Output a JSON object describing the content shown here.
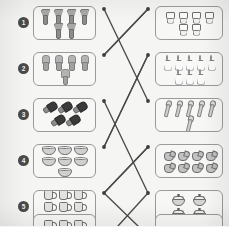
{
  "page": {
    "kind": "matching-worksheet",
    "background_color": "#f5f5f3",
    "box_border_color": "#9a9a9a",
    "line_color": "#4a4a4a",
    "marker_color": "#3d3d3d",
    "number_badge_color": "#4a4a4a",
    "visible_rows": 5,
    "partial_row_at_bottom": true
  },
  "rows": [
    {
      "number": "1",
      "left": {
        "item_name": "clothespin-clip",
        "count": 6,
        "glyph_class": "g-clip",
        "dot": {
          "x": 104,
          "y": 9
        }
      },
      "right": {
        "item_name": "small-cup-character",
        "count": 6,
        "glyph_class": "g-cupface",
        "dot": {
          "x": 148,
          "y": 9
        }
      }
    },
    {
      "number": "2",
      "left": {
        "item_name": "gray-bottle",
        "count": 5,
        "glyph_class": "g-bottle",
        "dot": {
          "x": 104,
          "y": 55
        }
      },
      "right": {
        "item_name": "candle",
        "count": 8,
        "glyph_class": "g-candle",
        "dot": {
          "x": 148,
          "y": 55
        }
      }
    },
    {
      "number": "3",
      "left": {
        "item_name": "dark-trowel",
        "count": 5,
        "glyph_class": "g-trowel",
        "dot": {
          "x": 104,
          "y": 101
        }
      },
      "right": {
        "item_name": "light-spoon",
        "count": 6,
        "glyph_class": "g-spoon",
        "dot": {
          "x": 148,
          "y": 101
        }
      }
    },
    {
      "number": "4",
      "left": {
        "item_name": "bowl",
        "count": 7,
        "glyph_class": "g-bowl",
        "dot": {
          "x": 104,
          "y": 147
        }
      },
      "right": {
        "item_name": "kettle",
        "count": 8,
        "glyph_class": "g-kettle",
        "dot": {
          "x": 148,
          "y": 147
        }
      }
    },
    {
      "number": "5",
      "left": {
        "item_name": "mug",
        "count": 8,
        "glyph_class": "g-mug",
        "dot": {
          "x": 104,
          "y": 193
        }
      },
      "right": {
        "item_name": "covered-pot",
        "count": 4,
        "glyph_class": "g-pot",
        "dot": {
          "x": 148,
          "y": 193
        }
      }
    }
  ],
  "partial_row": {
    "number": "6",
    "left": {
      "item_name": "mug",
      "count": 4,
      "glyph_class": "g-mug"
    },
    "right": {
      "item_name": "bowl",
      "count": 2,
      "glyph_class": "g-bowl"
    }
  },
  "connections": [
    {
      "from": {
        "x": 104,
        "y": 9
      },
      "to": {
        "x": 148,
        "y": 101
      }
    },
    {
      "from": {
        "x": 148,
        "y": 9
      },
      "to": {
        "x": 104,
        "y": 55
      }
    },
    {
      "from": {
        "x": 104,
        "y": 55
      },
      "to": {
        "x": 148,
        "y": 9
      }
    },
    {
      "from": {
        "x": 148,
        "y": 55
      },
      "to": {
        "x": 104,
        "y": 147
      }
    },
    {
      "from": {
        "x": 104,
        "y": 101
      },
      "to": {
        "x": 148,
        "y": 193
      }
    },
    {
      "from": {
        "x": 148,
        "y": 147
      },
      "to": {
        "x": 104,
        "y": 193
      }
    },
    {
      "from": {
        "x": 104,
        "y": 193
      },
      "to": {
        "x": 148,
        "y": 147
      }
    },
    {
      "from": {
        "x": 104,
        "y": 147
      },
      "to": {
        "x": 148,
        "y": 55
      }
    },
    {
      "from": {
        "x": 148,
        "y": 193
      },
      "to": {
        "x": 118,
        "y": 226
      }
    },
    {
      "from": {
        "x": 104,
        "y": 193
      },
      "to": {
        "x": 138,
        "y": 226
      }
    }
  ]
}
